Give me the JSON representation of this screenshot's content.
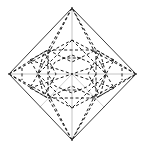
{
  "figure": {
    "kind": "geometric-line-diagram",
    "canvas": {
      "width": 143,
      "height": 148,
      "background": "#ffffff"
    },
    "corner_mark": "",
    "colors": {
      "outline": "#3b3b3b",
      "dashed": "#1a1a1a",
      "axis": "#bdbdbd",
      "axis_diagonal": "#c9c9c9",
      "background": "#ffffff",
      "corner_mark": "#cfcfcf"
    },
    "stroke_widths": {
      "outline": 1.0,
      "dashed": 1.0,
      "axis": 0.9
    },
    "dash_pattern": "3 2.4",
    "center": {
      "x": 72,
      "y": 74
    },
    "vertices": {
      "top": {
        "x": 72,
        "y": 8,
        "label": "N"
      },
      "right": {
        "x": 136,
        "y": 74,
        "label": "E"
      },
      "bottom": {
        "x": 72,
        "y": 140,
        "label": "S"
      },
      "left": {
        "x": 9,
        "y": 74,
        "label": "W"
      }
    },
    "axes": [
      {
        "name": "horizontal-axis",
        "x1": 9,
        "y1": 74,
        "x2": 136,
        "y2": 74
      },
      {
        "name": "vertical-axis",
        "x1": 72,
        "y1": 8,
        "x2": 72,
        "y2": 140
      },
      {
        "name": "diagonal-axis-sw",
        "x1": 72,
        "y1": 74,
        "x2": 40,
        "y2": 107
      },
      {
        "name": "diagonal-axis-se",
        "x1": 72,
        "y1": 74,
        "x2": 104,
        "y2": 107
      }
    ],
    "outline": {
      "name": "diamond-outline",
      "points": "72,8 136,74 72,140 9,74"
    },
    "dashed_paths": [
      {
        "name": "dashed-kite-top",
        "points": "72,8 48,50 72,62 96,50 72,8"
      },
      {
        "name": "dashed-kite-bottom",
        "points": "72,140 48,98 72,86 96,98 72,140"
      },
      {
        "name": "dashed-kite-left",
        "points": "9,74 44,52 56,74 44,96 9,74"
      },
      {
        "name": "dashed-kite-right",
        "points": "136,74 100,52 88,74 100,96 136,74"
      },
      {
        "name": "dashed-inner-octagon",
        "points": "72,55 89,62 96,74 89,86 72,93 55,86 48,74 55,62 72,55"
      },
      {
        "name": "dashed-square-upright",
        "points": "72,40 106,74 72,108 38,74 72,40"
      },
      {
        "name": "dashed-square-tilted",
        "points": "48,50 96,50 96,98 48,98 48,50"
      },
      {
        "name": "dashed-diag-nw",
        "points": "30,60 72,74"
      },
      {
        "name": "dashed-diag-ne",
        "points": "114,60 72,74"
      },
      {
        "name": "dashed-diag-sw",
        "points": "30,88 72,74"
      },
      {
        "name": "dashed-diag-se",
        "points": "114,88 72,74"
      },
      {
        "name": "dashed-spoke-nw",
        "points": "72,8 38,74"
      },
      {
        "name": "dashed-spoke-ne",
        "points": "72,8 106,74"
      },
      {
        "name": "dashed-spoke-sw",
        "points": "72,140 38,74"
      },
      {
        "name": "dashed-spoke-se",
        "points": "72,140 106,74"
      },
      {
        "name": "dashed-chord-w-up",
        "points": "9,74 72,40"
      },
      {
        "name": "dashed-chord-w-dn",
        "points": "9,74 72,108"
      },
      {
        "name": "dashed-chord-e-up",
        "points": "136,74 72,40"
      },
      {
        "name": "dashed-chord-e-dn",
        "points": "136,74 72,108"
      },
      {
        "name": "dashed-corner-nw-star",
        "points": "30,60 48,50 44,52 38,74 30,60"
      },
      {
        "name": "dashed-corner-ne-star",
        "points": "114,60 96,50 100,52 106,74 114,60"
      },
      {
        "name": "dashed-corner-sw-star",
        "points": "30,88 48,98 44,96 38,74 30,88"
      },
      {
        "name": "dashed-corner-se-star",
        "points": "114,88 96,98 100,96 106,74 114,88"
      },
      {
        "name": "dashed-mid-top-bar",
        "points": "62,58 82,58"
      },
      {
        "name": "dashed-mid-bottom-bar",
        "points": "62,90 82,90"
      },
      {
        "name": "dashed-mid-left-bar",
        "points": "22,68 22,80"
      },
      {
        "name": "dashed-mid-right-bar",
        "points": "122,68 122,80"
      }
    ]
  }
}
